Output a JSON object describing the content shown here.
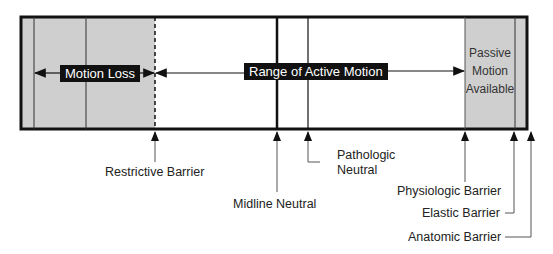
{
  "diagram": {
    "bands": {
      "motion_loss": "Motion Loss",
      "range_active": "Range of Active Motion",
      "passive": [
        "Passive",
        "Motion",
        "Available"
      ]
    },
    "markers": {
      "restrictive": "Restrictive Barrier",
      "midline": "Midline Neutral",
      "pathologic": [
        "Pathologic",
        "Neutral"
      ],
      "physiologic": "Physiologic Barrier",
      "elastic": "Elastic Barrier",
      "anatomic": "Anatomic Barrier"
    },
    "colors": {
      "shade": "#cfcfcf",
      "line": "#111111"
    }
  }
}
